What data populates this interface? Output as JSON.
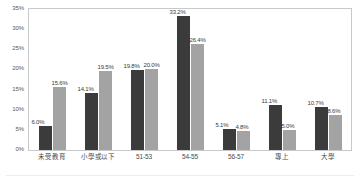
{
  "chart_data": {
    "type": "bar",
    "title": "",
    "subtitle": "",
    "xlabel": "",
    "ylabel": "",
    "ylim": [
      0,
      35
    ],
    "grid": false,
    "legend_position": "none",
    "value_suffix": "%",
    "categories": [
      "未受教育",
      "小學或以下",
      "51-53",
      "54-55",
      "56-57",
      "專上",
      "大學"
    ],
    "ytick_labels": [
      "0%",
      "5%",
      "10%",
      "15%",
      "20%",
      "25%",
      "30%",
      "35%"
    ],
    "ytick_values": [
      0,
      5,
      10,
      15,
      20,
      25,
      30,
      35
    ],
    "series": [
      {
        "name": "series-1",
        "color": "#3b3b3b",
        "values": [
          6.0,
          14.1,
          19.8,
          33.2,
          5.1,
          11.1,
          10.7
        ],
        "labels": [
          "6.0%",
          "14.1%",
          "19.8%",
          "33.2%",
          "5.1%",
          "11.1%",
          "10.7%"
        ]
      },
      {
        "name": "series-2",
        "color": "#a3a3a3",
        "values": [
          15.6,
          19.5,
          20.0,
          26.4,
          4.8,
          5.0,
          8.6
        ],
        "labels": [
          "15.6%",
          "19.5%",
          "20.0%",
          "26.4%",
          "4.8%",
          "5.0%",
          "8.6%"
        ]
      }
    ]
  },
  "colors": {
    "series_1": "#3b3b3b",
    "series_2": "#a3a3a3",
    "plot_border": "#c8c8c8",
    "axis_text": "#585858",
    "background": "#ffffff"
  }
}
